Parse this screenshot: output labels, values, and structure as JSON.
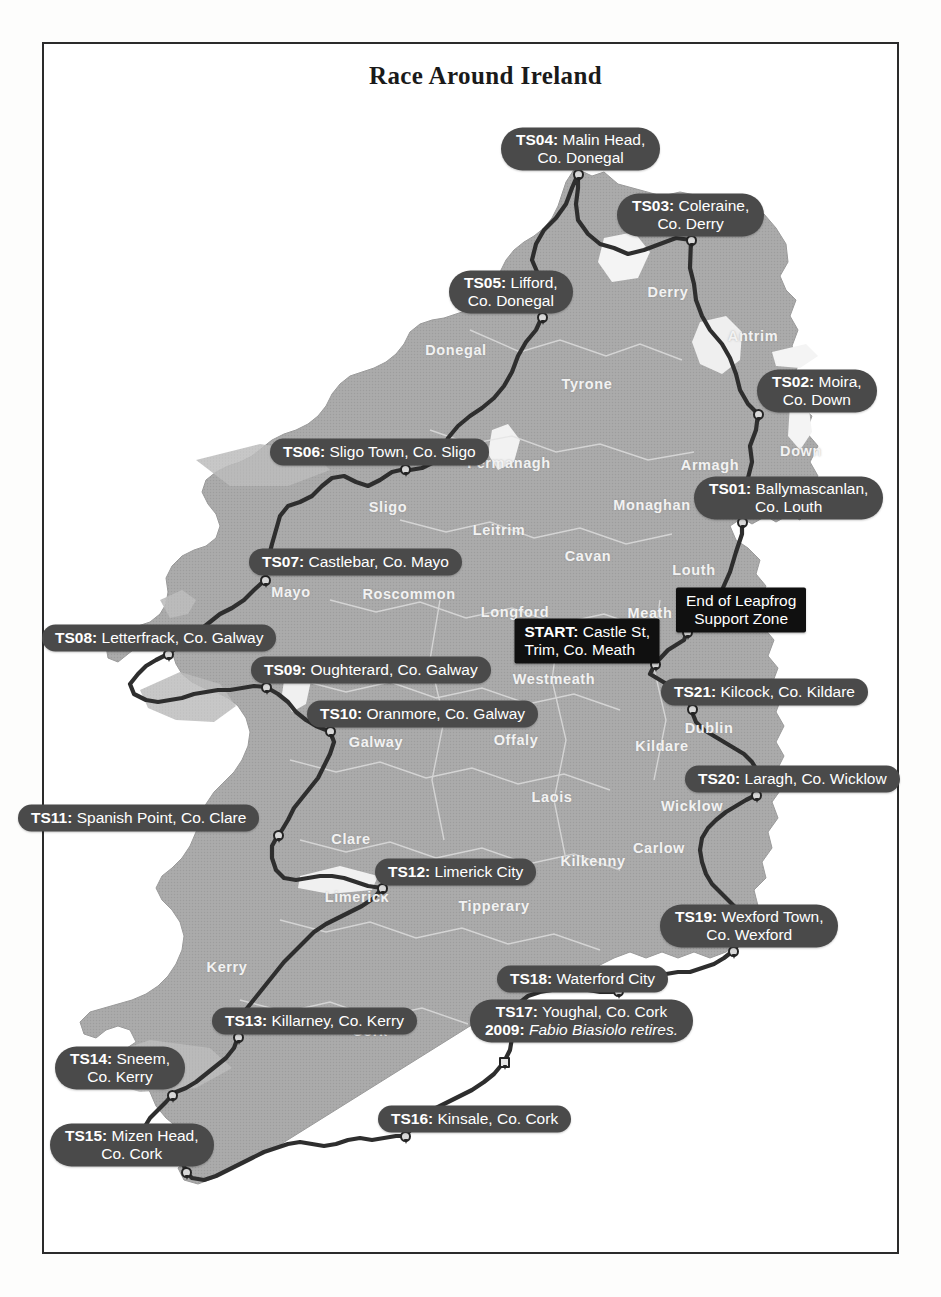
{
  "title": "Race Around Ireland",
  "colors": {
    "land": "#a9a9a9",
    "land_light": "#bdbdbd",
    "water": "#ffffff",
    "route": "#2e2e2e",
    "label_pill": "#4a4a4a",
    "label_box": "#101010",
    "label_text": "#ffffff",
    "county_text": "#f2f2f2",
    "frame": "#2b2b2b"
  },
  "stations": [
    {
      "id": "start",
      "code": "START:",
      "place": "Castle St,",
      "place2": "Trim, Co. Meath",
      "style": "boxed",
      "lines": 2,
      "anchor": "right",
      "x": 660,
      "y": 641,
      "marker_x": 655,
      "marker_y": 664,
      "marker_shape": "circle"
    },
    {
      "id": "leapfrog",
      "code": "",
      "place": "End of Leapfrog",
      "place2": "Support Zone",
      "style": "boxed",
      "lines": 2,
      "anchor": "left",
      "x": 676,
      "y": 610,
      "marker_x": 687,
      "marker_y": 632,
      "marker_shape": "circle"
    },
    {
      "id": "ts01",
      "code": "TS01:",
      "place": "Ballymascanlan,",
      "place2": "Co. Louth",
      "style": "pill",
      "lines": 2,
      "anchor": "left",
      "x": 694,
      "y": 498,
      "marker_x": 742,
      "marker_y": 522,
      "marker_shape": "circle"
    },
    {
      "id": "ts02",
      "code": "TS02:",
      "place": "Moira,",
      "place2": "Co. Down",
      "style": "pill",
      "lines": 2,
      "anchor": "left",
      "x": 757,
      "y": 391,
      "marker_x": 758,
      "marker_y": 414,
      "marker_shape": "circle"
    },
    {
      "id": "ts03",
      "code": "TS03:",
      "place": "Coleraine,",
      "place2": "Co. Derry",
      "style": "pill",
      "lines": 2,
      "anchor": "left",
      "x": 617,
      "y": 215,
      "marker_x": 691,
      "marker_y": 240,
      "marker_shape": "circle"
    },
    {
      "id": "ts04",
      "code": "TS04:",
      "place": "Malin Head,",
      "place2": "Co. Donegal",
      "style": "pill",
      "lines": 2,
      "anchor": "left",
      "x": 501,
      "y": 149,
      "marker_x": 578,
      "marker_y": 174,
      "marker_shape": "circle"
    },
    {
      "id": "ts05",
      "code": "TS05:",
      "place": "Lifford,",
      "place2": "Co. Donegal",
      "style": "pill",
      "lines": 2,
      "anchor": "left",
      "x": 449,
      "y": 292,
      "marker_x": 542,
      "marker_y": 317,
      "marker_shape": "circle"
    },
    {
      "id": "ts06",
      "code": "TS06:",
      "place": "Sligo Town, Co. Sligo",
      "style": "pill",
      "lines": 1,
      "anchor": "left",
      "x": 270,
      "y": 452,
      "marker_x": 405,
      "marker_y": 469,
      "marker_shape": "circle"
    },
    {
      "id": "ts07",
      "code": "TS07:",
      "place": "Castlebar, Co. Mayo",
      "style": "pill",
      "lines": 1,
      "anchor": "left",
      "x": 249,
      "y": 562,
      "marker_x": 265,
      "marker_y": 580,
      "marker_shape": "circle"
    },
    {
      "id": "ts08",
      "code": "TS08:",
      "place": "Letterfrack, Co. Galway",
      "style": "pill",
      "lines": 1,
      "anchor": "left",
      "x": 42,
      "y": 638,
      "marker_x": 168,
      "marker_y": 654,
      "marker_shape": "circle"
    },
    {
      "id": "ts09",
      "code": "TS09:",
      "place": "Oughterard, Co. Galway",
      "style": "pill",
      "lines": 1,
      "anchor": "left",
      "x": 251,
      "y": 670,
      "marker_x": 266,
      "marker_y": 687,
      "marker_shape": "circle"
    },
    {
      "id": "ts10",
      "code": "TS10:",
      "place": "Oranmore, Co. Galway",
      "style": "pill",
      "lines": 1,
      "anchor": "left",
      "x": 307,
      "y": 714,
      "marker_x": 330,
      "marker_y": 731,
      "marker_shape": "circle"
    },
    {
      "id": "ts11",
      "code": "TS11:",
      "place": "Spanish Point, Co. Clare",
      "style": "pill",
      "lines": 1,
      "anchor": "left",
      "x": 18,
      "y": 818,
      "marker_x": 278,
      "marker_y": 835,
      "marker_shape": "circle"
    },
    {
      "id": "ts12",
      "code": "TS12:",
      "place": "Limerick City",
      "style": "pill",
      "lines": 1,
      "anchor": "left",
      "x": 375,
      "y": 872,
      "marker_x": 382,
      "marker_y": 888,
      "marker_shape": "circle"
    },
    {
      "id": "ts13",
      "code": "TS13:",
      "place": "Killarney, Co. Kerry",
      "style": "pill",
      "lines": 1,
      "anchor": "left",
      "x": 212,
      "y": 1021,
      "marker_x": 238,
      "marker_y": 1037,
      "marker_shape": "circle"
    },
    {
      "id": "ts14",
      "code": "TS14:",
      "place": "Sneem,",
      "place2": "Co. Kerry",
      "style": "pill",
      "lines": 2,
      "anchor": "left",
      "x": 55,
      "y": 1068,
      "marker_x": 172,
      "marker_y": 1095,
      "marker_shape": "circle"
    },
    {
      "id": "ts15",
      "code": "TS15:",
      "place": "Mizen Head,",
      "place2": "Co. Cork",
      "style": "pill",
      "lines": 2,
      "anchor": "left",
      "x": 50,
      "y": 1145,
      "marker_x": 186,
      "marker_y": 1172,
      "marker_shape": "circle"
    },
    {
      "id": "ts16",
      "code": "TS16:",
      "place": "Kinsale, Co. Cork",
      "style": "pill",
      "lines": 1,
      "anchor": "left",
      "x": 378,
      "y": 1119,
      "marker_x": 405,
      "marker_y": 1136,
      "marker_shape": "circle"
    },
    {
      "id": "ts17",
      "code": "TS17:",
      "place": "Youghal, Co. Cork",
      "note_year": "2009:",
      "note": "Fabio Biasiolo retires.",
      "style": "pill",
      "lines": 2,
      "anchor": "left",
      "x": 470,
      "y": 1021,
      "marker_x": 504,
      "marker_y": 1062,
      "marker_shape": "square"
    },
    {
      "id": "ts18",
      "code": "TS18:",
      "place": "Waterford City",
      "style": "pill",
      "lines": 1,
      "anchor": "left",
      "x": 497,
      "y": 979,
      "marker_x": 618,
      "marker_y": 991,
      "marker_shape": "circle"
    },
    {
      "id": "ts19",
      "code": "TS19:",
      "place": "Wexford Town,",
      "place2": "Co. Wexford",
      "style": "pill",
      "lines": 2,
      "anchor": "left",
      "x": 660,
      "y": 926,
      "marker_x": 733,
      "marker_y": 951,
      "marker_shape": "circle"
    },
    {
      "id": "ts20",
      "code": "TS20:",
      "place": "Laragh, Co. Wicklow",
      "style": "pill",
      "lines": 1,
      "anchor": "left",
      "x": 685,
      "y": 779,
      "marker_x": 756,
      "marker_y": 795,
      "marker_shape": "circle"
    },
    {
      "id": "ts21",
      "code": "TS21:",
      "place": "Kilcock, Co. Kildare",
      "style": "pill",
      "lines": 1,
      "anchor": "left",
      "x": 661,
      "y": 692,
      "marker_x": 692,
      "marker_y": 709,
      "marker_shape": "circle"
    }
  ],
  "counties": [
    {
      "name": "Donegal",
      "x": 456,
      "y": 350
    },
    {
      "name": "Derry",
      "x": 668,
      "y": 292
    },
    {
      "name": "Antrim",
      "x": 753,
      "y": 336
    },
    {
      "name": "Tyrone",
      "x": 587,
      "y": 384
    },
    {
      "name": "Down",
      "x": 801,
      "y": 451
    },
    {
      "name": "Fermanagh",
      "x": 509,
      "y": 463
    },
    {
      "name": "Armagh",
      "x": 710,
      "y": 465
    },
    {
      "name": "Sligo",
      "x": 388,
      "y": 507
    },
    {
      "name": "Monaghan",
      "x": 652,
      "y": 505
    },
    {
      "name": "Leitrim",
      "x": 499,
      "y": 530
    },
    {
      "name": "Cavan",
      "x": 588,
      "y": 556
    },
    {
      "name": "Louth",
      "x": 694,
      "y": 570
    },
    {
      "name": "Mayo",
      "x": 291,
      "y": 592
    },
    {
      "name": "Roscommon",
      "x": 409,
      "y": 594
    },
    {
      "name": "Longford",
      "x": 515,
      "y": 612
    },
    {
      "name": "Meath",
      "x": 650,
      "y": 613
    },
    {
      "name": "Westmeath",
      "x": 554,
      "y": 679
    },
    {
      "name": "Galway",
      "x": 376,
      "y": 742
    },
    {
      "name": "Dublin",
      "x": 709,
      "y": 728
    },
    {
      "name": "Kildare",
      "x": 662,
      "y": 746
    },
    {
      "name": "Offaly",
      "x": 516,
      "y": 740
    },
    {
      "name": "Laois",
      "x": 552,
      "y": 797
    },
    {
      "name": "Wicklow",
      "x": 692,
      "y": 806
    },
    {
      "name": "Clare",
      "x": 351,
      "y": 839
    },
    {
      "name": "Carlow",
      "x": 659,
      "y": 848
    },
    {
      "name": "Kilkenny",
      "x": 593,
      "y": 861
    },
    {
      "name": "Tipperary",
      "x": 494,
      "y": 906
    },
    {
      "name": "Limerick",
      "x": 357,
      "y": 897
    },
    {
      "name": "Wexford",
      "x": 726,
      "y": 915
    },
    {
      "name": "Kerry",
      "x": 227,
      "y": 967
    },
    {
      "name": "Waterford",
      "x": 558,
      "y": 986
    },
    {
      "name": "Cork",
      "x": 370,
      "y": 1031
    }
  ]
}
